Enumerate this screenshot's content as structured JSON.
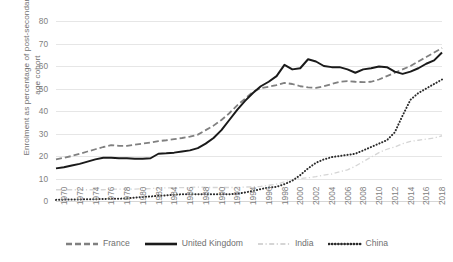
{
  "chart_data": {
    "type": "line",
    "title": "",
    "xlabel": "",
    "ylabel": "Enrolment as percentage of post-secondary age cohort",
    "ylim": [
      0,
      80
    ],
    "ytick_labels": [
      "0",
      "10",
      "20",
      "30",
      "40",
      "50",
      "60",
      "70",
      "80"
    ],
    "ytick_values": [
      0,
      10,
      20,
      30,
      40,
      50,
      60,
      70,
      80
    ],
    "grid": true,
    "legend_position": "bottom",
    "xlim": [
      1970,
      2019
    ],
    "xtick_labels": [
      "1970",
      "1972",
      "1974",
      "1976",
      "1978",
      "1980",
      "1982",
      "1984",
      "1986",
      "1988",
      "1990",
      "1992",
      "1994",
      "1996",
      "1998",
      "2000",
      "2002",
      "2004",
      "2006",
      "2008",
      "2010",
      "2012",
      "2014",
      "2016",
      "2018"
    ],
    "x": [
      1970,
      1971,
      1972,
      1973,
      1974,
      1975,
      1976,
      1977,
      1978,
      1979,
      1980,
      1981,
      1982,
      1983,
      1984,
      1985,
      1986,
      1987,
      1988,
      1989,
      1990,
      1991,
      1992,
      1993,
      1994,
      1995,
      1996,
      1997,
      1998,
      1999,
      2000,
      2001,
      2002,
      2003,
      2004,
      2005,
      2006,
      2007,
      2008,
      2009,
      2010,
      2011,
      2012,
      2013,
      2014,
      2015,
      2016,
      2017,
      2018,
      2019
    ],
    "series": [
      {
        "name": "France",
        "style": "dashed",
        "color": "#808080",
        "values": [
          18.5,
          19.2,
          20.0,
          21.0,
          22.0,
          23.0,
          24.0,
          24.8,
          24.5,
          24.5,
          25.0,
          25.5,
          26.0,
          26.6,
          27.0,
          27.5,
          28.0,
          28.6,
          29.5,
          31.5,
          33.5,
          36.0,
          39.0,
          42.5,
          45.5,
          48.5,
          50.2,
          50.8,
          51.5,
          52.5,
          52.0,
          51.0,
          50.5,
          50.3,
          51.0,
          52.0,
          53.0,
          53.3,
          53.0,
          52.8,
          53.0,
          54.0,
          55.5,
          57.0,
          58.5,
          60.0,
          62.0,
          64.0,
          66.0,
          68.0
        ]
      },
      {
        "name": "United Kingdom",
        "style": "solid",
        "color": "#1a1a1a",
        "values": [
          14.5,
          15.0,
          15.8,
          16.5,
          17.5,
          18.5,
          19.2,
          19.2,
          19.0,
          19.0,
          18.8,
          18.8,
          19.0,
          21.0,
          21.2,
          21.5,
          22.0,
          22.5,
          23.5,
          25.5,
          28.0,
          31.5,
          36.0,
          40.5,
          44.5,
          48.0,
          51.0,
          53.0,
          55.5,
          60.5,
          58.5,
          59.0,
          63.0,
          62.0,
          60.0,
          59.5,
          59.5,
          58.5,
          57.0,
          58.5,
          59.0,
          59.8,
          59.5,
          57.5,
          56.5,
          57.5,
          59.0,
          61.0,
          62.5,
          66.0
        ]
      },
      {
        "name": "India",
        "style": "dashdot",
        "color": "#d5d5d5",
        "values": [
          5.0,
          5.0,
          5.0,
          5.0,
          5.0,
          5.0,
          5.0,
          5.2,
          5.3,
          5.3,
          5.3,
          5.4,
          5.5,
          5.8,
          5.8,
          5.9,
          5.9,
          6.0,
          6.2,
          6.0,
          6.0,
          6.0,
          6.0,
          6.0,
          6.2,
          6.3,
          6.5,
          7.0,
          7.5,
          8.5,
          9.5,
          10.0,
          10.3,
          10.8,
          11.5,
          12.0,
          13.0,
          13.8,
          15.5,
          17.5,
          19.5,
          21.5,
          23.0,
          24.0,
          25.5,
          26.5,
          27.0,
          27.5,
          28.0,
          29.0
        ]
      },
      {
        "name": "China",
        "style": "dotted",
        "color": "#2a2a2a",
        "values": [
          0.5,
          0.6,
          0.7,
          0.7,
          0.8,
          0.8,
          0.9,
          1.0,
          1.0,
          1.2,
          1.5,
          1.8,
          2.0,
          2.3,
          2.5,
          2.8,
          3.0,
          3.0,
          3.0,
          3.0,
          3.0,
          3.0,
          3.0,
          3.2,
          3.8,
          4.5,
          5.3,
          6.0,
          6.3,
          7.5,
          9.0,
          11.5,
          14.5,
          17.0,
          18.5,
          19.5,
          20.0,
          20.5,
          21.0,
          22.5,
          24.0,
          25.5,
          27.0,
          30.5,
          38.0,
          45.0,
          48.0,
          50.0,
          52.0,
          54.0
        ]
      }
    ]
  }
}
